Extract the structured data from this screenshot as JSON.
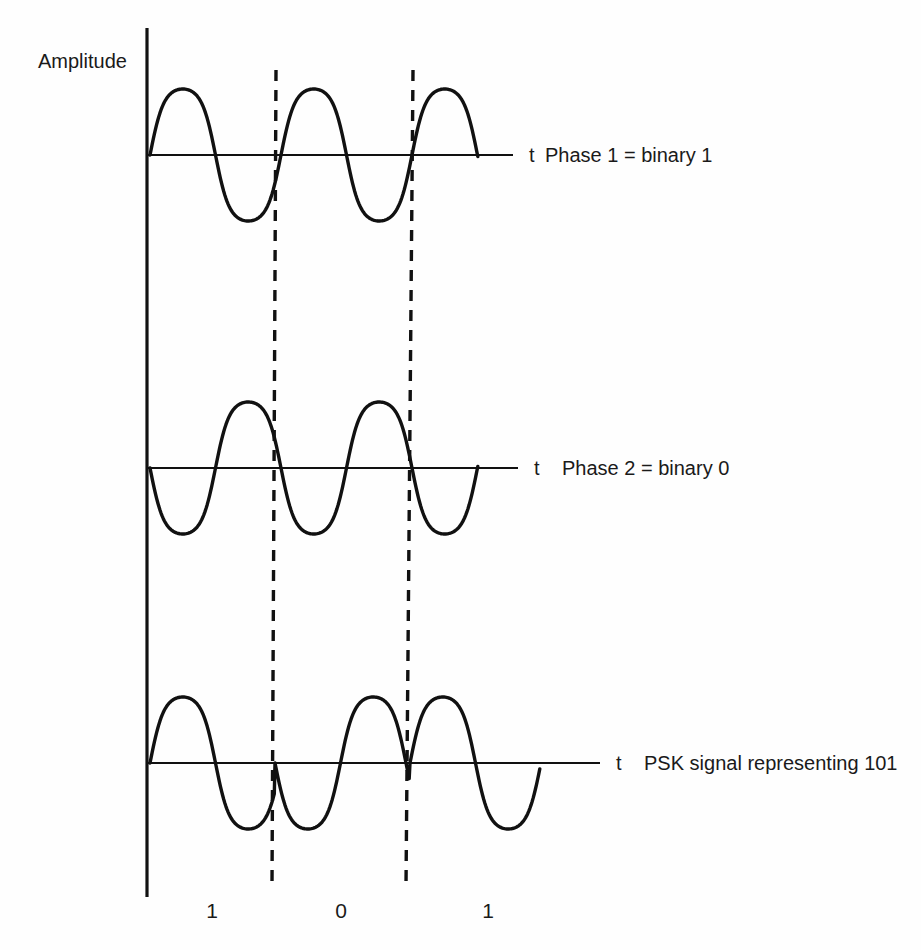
{
  "figure": {
    "y_axis_label": "Amplitude",
    "time_axis_symbol": "t",
    "background_color": "#fefefe",
    "line_color": "#111111"
  },
  "waveforms": [
    {
      "id": "phase-1",
      "axis_symbol": "t",
      "caption": "Phase 1 = binary 1",
      "baseline_y": 155,
      "amplitude": 66,
      "x_start": 150,
      "x_end": 478,
      "axis_end_x": 513,
      "phase_degrees": 0,
      "cycles": 2.5,
      "period_px": 131,
      "description": "Reference carrier starting with a positive half cycle"
    },
    {
      "id": "phase-2",
      "axis_symbol": "t",
      "caption": "Phase 2 = binary 0",
      "baseline_y": 468,
      "amplitude": 66,
      "x_start": 150,
      "x_end": 478,
      "axis_end_x": 518,
      "phase_degrees": 180,
      "cycles": 2.5,
      "period_px": 131,
      "description": "Carrier inverted 180 degrees, starting with a negative half cycle"
    },
    {
      "id": "psk-signal",
      "axis_symbol": "t",
      "caption": "PSK signal representing 101",
      "baseline_y": 763,
      "amplitude": 66,
      "x_start": 150,
      "x_end": 540,
      "axis_end_x": 600,
      "period_px": 131,
      "description": "Modulated signal: phase flips 180 degrees at each bit boundary"
    }
  ],
  "bit_intervals": [
    {
      "bit": "1",
      "phase_degrees": 0,
      "x_start": 150,
      "x_end": 275,
      "label_x": 212
    },
    {
      "bit": "0",
      "phase_degrees": 180,
      "x_start": 275,
      "x_end": 410,
      "label_x": 341
    },
    {
      "bit": "1",
      "phase_degrees": 0,
      "x_start": 410,
      "x_end": 540,
      "label_x": 488
    }
  ],
  "dividers": [
    {
      "id": "bit-boundary-1",
      "x_top": 276,
      "x_bottom": 272,
      "y_top": 70,
      "y_bottom": 885
    },
    {
      "id": "bit-boundary-2",
      "x_top": 413,
      "x_bottom": 406,
      "y_top": 70,
      "y_bottom": 885
    }
  ],
  "vertical_axis": {
    "x": 147,
    "y_top": 28,
    "y_bottom": 897
  },
  "bit_labels_row": {
    "y": 918
  },
  "labels": {
    "amplitude_x": 38,
    "amplitude_y": 68
  }
}
